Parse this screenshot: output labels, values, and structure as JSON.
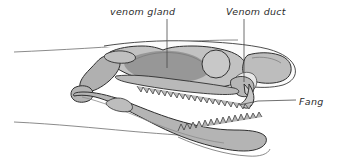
{
  "figure": {
    "background_color": "#ffffff",
    "style": "grayscale line illustration with tonal shading"
  },
  "labels": {
    "venom_gland": "venom gland",
    "venom_duct": "Venom duct",
    "fang": "Fang"
  },
  "colors": {
    "outline": "#2e2e2e",
    "bone_light": "#cfcfcf",
    "bone_mid": "#b4b4b4",
    "bone_dark": "#9a9a9a",
    "gland_shade": "#8f8f8f",
    "duct_highlight": "#e2e2e2",
    "skin_line": "#6d6d6d",
    "text": "#2b2b2b",
    "leader_line": "#4a4a4a"
  },
  "leaders": [
    {
      "name": "venom-gland-leader",
      "from": [
        167,
        18
      ],
      "to": [
        167,
        68
      ]
    },
    {
      "name": "venom-duct-leader",
      "from": [
        244,
        18
      ],
      "to": [
        244,
        82
      ]
    },
    {
      "name": "fang-leader",
      "from": [
        240,
        103
      ],
      "to": [
        296,
        99
      ]
    }
  ],
  "anatomy": {
    "parts": [
      "cranium",
      "venom gland",
      "venom duct",
      "orbit",
      "maxilla with fang",
      "fang",
      "palatine tooth row",
      "quadrate",
      "lower jaw (mandible)",
      "mandibular tooth row",
      "skin outline"
    ]
  }
}
